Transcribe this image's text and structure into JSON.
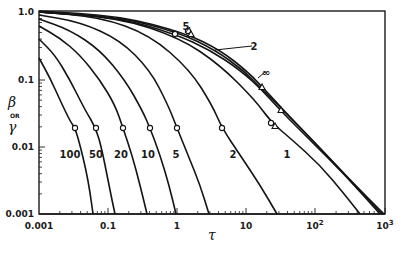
{
  "chart_data": {
    "type": "line",
    "title": "",
    "xlabel": "τ",
    "ylabel": "β or γ",
    "xscale": "log",
    "yscale": "log",
    "xlim": [
      0.001,
      1000
    ],
    "ylim": [
      0.001,
      1.0
    ],
    "grid": false,
    "x_tick_labels": [
      "0.001",
      "0.1",
      "1",
      "10",
      "10²",
      "10³"
    ],
    "y_tick_labels": [
      "1.0",
      "0.1",
      "0.01",
      "0.001"
    ],
    "series": [
      {
        "name": "100",
        "label_pos": [
          70,
          158
        ],
        "marker": {
          "type": "circle",
          "at": [
            0.03,
            0.02
          ]
        },
        "px": [
          [
            39,
            58
          ],
          [
            50,
            78
          ],
          [
            60,
            100
          ],
          [
            70,
            121
          ],
          [
            75,
            128
          ],
          [
            80,
            145
          ],
          [
            86,
            170
          ],
          [
            90,
            192
          ],
          [
            93,
            214
          ]
        ]
      },
      {
        "name": "50",
        "label_pos": [
          96,
          158
        ],
        "marker": {
          "type": "circle",
          "at": [
            0.06,
            0.02
          ]
        },
        "px": [
          [
            39,
            39
          ],
          [
            55,
            55
          ],
          [
            70,
            80
          ],
          [
            85,
            110
          ],
          [
            96,
            128
          ],
          [
            102,
            150
          ],
          [
            108,
            180
          ],
          [
            112,
            200
          ],
          [
            115,
            214
          ]
        ]
      },
      {
        "name": "20",
        "label_pos": [
          121,
          158
        ],
        "marker": {
          "type": "circle",
          "at": [
            0.15,
            0.02
          ]
        },
        "px": [
          [
            39,
            26
          ],
          [
            60,
            38
          ],
          [
            80,
            55
          ],
          [
            100,
            80
          ],
          [
            115,
            105
          ],
          [
            123,
            128
          ],
          [
            132,
            155
          ],
          [
            140,
            185
          ],
          [
            147,
            214
          ]
        ]
      },
      {
        "name": "10",
        "label_pos": [
          148,
          158
        ],
        "marker": {
          "type": "circle",
          "at": [
            0.4,
            0.02
          ]
        },
        "px": [
          [
            39,
            19
          ],
          [
            70,
            30
          ],
          [
            100,
            50
          ],
          [
            125,
            80
          ],
          [
            142,
            110
          ],
          [
            150,
            128
          ],
          [
            160,
            155
          ],
          [
            169,
            185
          ],
          [
            176,
            214
          ]
        ]
      },
      {
        "name": "5",
        "label_pos": [
          176,
          158
        ],
        "marker": {
          "type": "circle",
          "at": [
            1.0,
            0.02
          ]
        },
        "px": [
          [
            39,
            15
          ],
          [
            80,
            22
          ],
          [
            120,
            40
          ],
          [
            150,
            70
          ],
          [
            168,
            105
          ],
          [
            177,
            128
          ],
          [
            190,
            160
          ],
          [
            200,
            185
          ],
          [
            209,
            214
          ]
        ]
      },
      {
        "name": "2",
        "label_pos": [
          233,
          158
        ],
        "marker": {
          "type": "circle",
          "at": [
            5,
            0.02
          ]
        },
        "px": [
          [
            39,
            12
          ],
          [
            100,
            17
          ],
          [
            150,
            35
          ],
          [
            190,
            70
          ],
          [
            212,
            105
          ],
          [
            222,
            128
          ],
          [
            240,
            155
          ],
          [
            260,
            185
          ],
          [
            277,
            214
          ]
        ]
      },
      {
        "name": "1",
        "label_pos": [
          287,
          158
        ],
        "marker": {
          "type": "circle",
          "at": [
            25,
            0.02
          ]
        },
        "px": [
          [
            39,
            12
          ],
          [
            120,
            18
          ],
          [
            180,
            38
          ],
          [
            220,
            65
          ],
          [
            255,
            100
          ],
          [
            271,
            122
          ],
          [
            290,
            138
          ],
          [
            320,
            165
          ],
          [
            345,
            195
          ],
          [
            360,
            214
          ]
        ]
      },
      {
        "name": "5 (upper)",
        "label_pos": [
          186,
          30
        ],
        "marker": {
          "type": "circle",
          "at": [
            0.3,
            0.5
          ]
        },
        "px": [
          [
            39,
            12
          ],
          [
            120,
            18
          ],
          [
            175,
            34
          ],
          [
            210,
            50
          ],
          [
            240,
            70
          ],
          [
            262,
            90
          ],
          [
            280,
            110
          ],
          [
            310,
            140
          ],
          [
            345,
            175
          ],
          [
            380,
            214
          ]
        ]
      },
      {
        "name": "2 (upper)",
        "label_pos": [
          254,
          50
        ],
        "marker": {
          "type": "triangle",
          "at": [
            0.4,
            0.5
          ]
        },
        "px": [
          [
            39,
            12
          ],
          [
            120,
            17
          ],
          [
            180,
            33
          ],
          [
            215,
            50
          ],
          [
            243,
            70
          ],
          [
            265,
            92
          ],
          [
            285,
            112
          ],
          [
            315,
            143
          ],
          [
            350,
            180
          ],
          [
            382,
            214
          ]
        ]
      },
      {
        "name": "∞",
        "label_pos": [
          266,
          76
        ],
        "marker": {
          "type": "triangle",
          "at": [
            3,
            0.12
          ]
        },
        "px": [
          [
            39,
            11
          ],
          [
            120,
            16
          ],
          [
            185,
            33
          ],
          [
            220,
            50
          ],
          [
            248,
            72
          ],
          [
            268,
            93
          ],
          [
            288,
            115
          ],
          [
            320,
            148
          ],
          [
            352,
            182
          ],
          [
            384,
            214
          ]
        ]
      }
    ],
    "annotations": [
      {
        "text": "5",
        "leader_from": [
          185,
          33
        ],
        "leader_to": [
          190,
          27
        ]
      },
      {
        "text": "2",
        "leader_from": [
          215,
          50
        ],
        "leader_to": [
          252,
          46
        ]
      },
      {
        "text": "∞",
        "leader_from": [
          258,
          78
        ],
        "leader_to": [
          265,
          72
        ]
      }
    ]
  },
  "axes": {
    "x": {
      "label": "τ",
      "ticks": [
        {
          "label": "0.001",
          "px": 39
        },
        {
          "label": "0.1",
          "px": 108
        },
        {
          "label": "1",
          "px": 177
        },
        {
          "label": "10",
          "px": 246
        },
        {
          "label": "10",
          "sup": "2",
          "px": 315
        },
        {
          "label": "10",
          "sup": "3",
          "px": 385
        }
      ]
    },
    "y": {
      "label_top": "β",
      "label_mid": "OR",
      "label_bot": "γ",
      "ticks": [
        {
          "label": "1.0",
          "px": 12
        },
        {
          "label": "0.1",
          "px": 80
        },
        {
          "label": "0.01",
          "px": 147
        },
        {
          "label": "0.001",
          "px": 214
        }
      ]
    }
  }
}
